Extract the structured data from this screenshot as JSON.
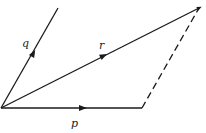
{
  "diagram": {
    "type": "vector-parallelogram",
    "colors": {
      "line": "#1a1a1a",
      "background": "#ffffff"
    },
    "vectors": [
      {
        "label": "p",
        "from": [
          1,
          108
        ],
        "to": [
          142,
          108
        ],
        "style": "solid"
      },
      {
        "label": "q",
        "from": [
          1,
          108
        ],
        "to": [
          58,
          8
        ],
        "style": "solid"
      },
      {
        "label": "r",
        "from": [
          1,
          108
        ],
        "to": [
          199,
          8
        ],
        "style": "solid"
      }
    ],
    "dashed_edge": {
      "from": [
        142,
        108
      ],
      "to": [
        199,
        8
      ]
    },
    "labels": {
      "p": "p",
      "q": "q",
      "r": "r"
    }
  }
}
